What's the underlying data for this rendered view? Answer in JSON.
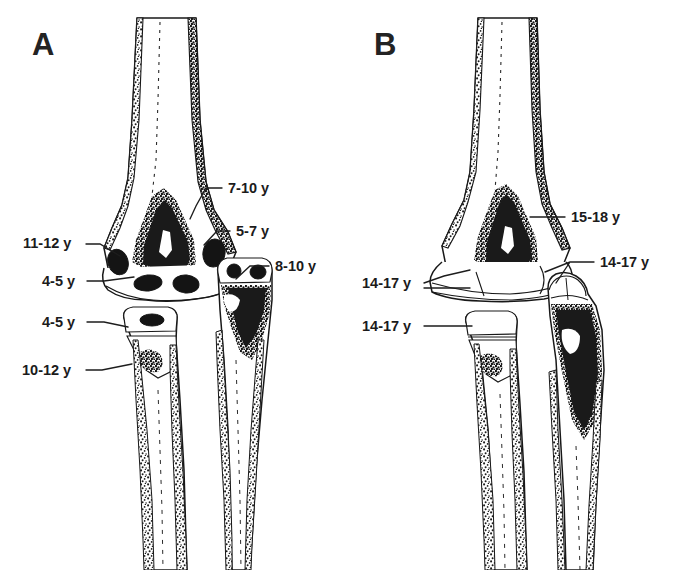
{
  "figure": {
    "kind": "anatomical-line-drawing",
    "background_color": "#ffffff",
    "ink_color": "#1a1a1a",
    "width": 693,
    "height": 570
  },
  "panels": [
    {
      "id": "A",
      "letter": "A",
      "caption_letter_position": {
        "x": 32,
        "y": 55
      },
      "description": "Appearance ages of secondary ossification centers about the elbow",
      "annotations": [
        {
          "id": "a-lateral-epicondyle",
          "label": "7-10 y",
          "side": "right",
          "text_x": 228,
          "text_y": 193,
          "leader": "M 222 188 L 206 188 L 196 206 L 190 219"
        },
        {
          "id": "a-lateral-condyle",
          "label": "5-7 y",
          "side": "right",
          "text_x": 236,
          "text_y": 236,
          "leader": "M 230 231 L 217 231 L 204 245"
        },
        {
          "id": "a-medial-epicondyle",
          "label": "11-12 y",
          "side": "left",
          "text_x": 23,
          "text_y": 248,
          "leader": "M 86 244 L 100 244 L 120 256"
        },
        {
          "id": "a-trochlea",
          "label": "4-5 y",
          "side": "left",
          "text_x": 42,
          "text_y": 286,
          "leader": "M 87 281 L 104 281 L 134 277"
        },
        {
          "id": "a-olecranon",
          "label": "8-10 y",
          "side": "right",
          "text_x": 275,
          "text_y": 271,
          "leader": "M 269 266 L 250 266 L 236 279"
        },
        {
          "id": "a-radial-head",
          "label": "4-5 y",
          "side": "left",
          "text_x": 42,
          "text_y": 327,
          "leader": "M 87 322 L 104 322 L 128 327"
        },
        {
          "id": "a-radial-tuberosity",
          "label": "10-12 y",
          "side": "left",
          "text_x": 22,
          "text_y": 375,
          "leader": "M 86 370 L 102 370 L 132 364"
        }
      ]
    },
    {
      "id": "B",
      "letter": "B",
      "caption_letter_position": {
        "x": 374,
        "y": 55
      },
      "description": "Fusion ages of the elbow secondary ossification centers",
      "annotations": [
        {
          "id": "b-distal-humerus",
          "label": "15-18 y",
          "side": "right",
          "text_x": 571,
          "text_y": 222,
          "leader": "M 565 217 L 530 217"
        },
        {
          "id": "b-olecranon-proximal-ulna",
          "label": "14-17 y",
          "side": "right",
          "text_x": 600,
          "text_y": 267,
          "leader": "M 594 262 L 570 262 L 545 272 M 570 262 L 556 283"
        },
        {
          "id": "b-medial-trochlea",
          "label": "14-17 y",
          "side": "left",
          "text_x": 362,
          "text_y": 288,
          "leader": "M 424 283 L 444 276 L 470 270 M 424 288 L 470 288"
        },
        {
          "id": "b-radial-head",
          "label": "14-17 y",
          "side": "left",
          "text_x": 362,
          "text_y": 331,
          "leader": "M 424 326 L 448 326 L 472 326"
        }
      ]
    }
  ]
}
